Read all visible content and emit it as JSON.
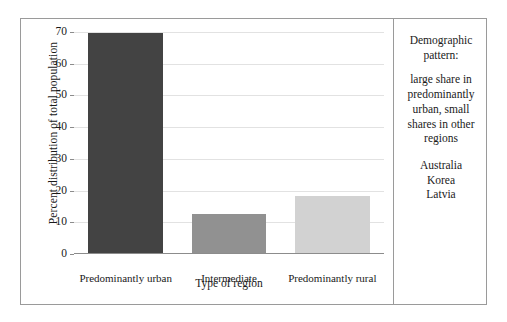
{
  "chart_data": {
    "type": "bar",
    "title": "",
    "xlabel": "Type of region",
    "ylabel": "Percent distribution of total population",
    "categories": [
      "Predominantly urban",
      "Intermediate",
      "Predominantly rural"
    ],
    "values": [
      69.5,
      12.4,
      18.0
    ],
    "series": [
      {
        "name": "Percent distribution of total population",
        "values": [
          69.5,
          12.4,
          18.0
        ]
      }
    ],
    "bar_colors": [
      "#434343",
      "#919191",
      "#d2d2d2"
    ],
    "ylim": [
      0,
      70
    ],
    "y_ticks": [
      0,
      10,
      20,
      30,
      40,
      50,
      60,
      70
    ],
    "y_tick_labels": [
      "0",
      "10",
      "20",
      "30",
      "40",
      "50",
      "60",
      "70"
    ],
    "grid": true,
    "grid_axis": "y",
    "legend": false,
    "legend_position": "none"
  },
  "side_panel": {
    "heading": "Demographic pattern:",
    "description": "large share in predominantly urban, small shares in other regions",
    "countries": [
      "Australia",
      "Korea",
      "Latvia"
    ]
  },
  "colors": {
    "border": "#9a9a9a",
    "gridline": "#e2e2e2",
    "axis": "#8c8c8c",
    "text": "#1a1a1a",
    "background": "#ffffff"
  }
}
